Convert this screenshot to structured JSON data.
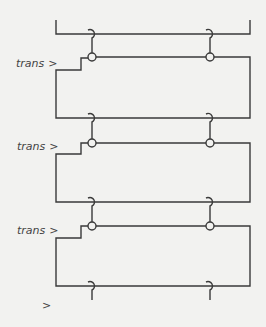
{
  "diagram": {
    "type": "circuit-ladder",
    "colors": {
      "background": "#f2f2f0",
      "line": "#3a3a3a",
      "text": "#444444"
    },
    "stages": [
      {
        "label": "trans",
        "prompt": ">"
      },
      {
        "label": "trans",
        "prompt": ">"
      },
      {
        "label": "trans",
        "prompt": ">"
      }
    ],
    "final_prompt": {
      "label": "",
      "prompt": ">"
    },
    "connectors_per_stage": 2,
    "connector_symbols": [
      "hook-crossover",
      "circle-node"
    ]
  }
}
